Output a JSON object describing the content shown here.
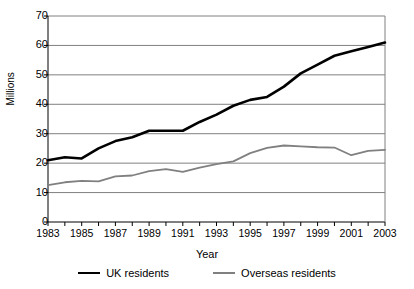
{
  "chart_data": {
    "type": "line",
    "title": "",
    "xlabel": "Year",
    "ylabel": "Millions",
    "xlim": [
      1983,
      2003
    ],
    "ylim": [
      0,
      70
    ],
    "ytick_step": 10,
    "yticks": [
      70,
      60,
      50,
      40,
      30,
      20,
      10,
      0
    ],
    "xticks": [
      1983,
      1984,
      1985,
      1986,
      1987,
      1988,
      1989,
      1990,
      1991,
      1992,
      1993,
      1994,
      1995,
      1996,
      1997,
      1998,
      1999,
      2000,
      2001,
      2002,
      2003
    ],
    "xtick_labels": [
      "1983",
      "",
      "1985",
      "",
      "1987",
      "",
      "1989",
      "",
      "1991",
      "",
      "1993",
      "",
      "1995",
      "",
      "1997",
      "",
      "1999",
      "",
      "2001",
      "",
      "2003"
    ],
    "grid": "horizontal",
    "legend_position": "bottom",
    "x": [
      1983,
      1984,
      1985,
      1986,
      1987,
      1988,
      1989,
      1990,
      1991,
      1992,
      1993,
      1994,
      1995,
      1996,
      1997,
      1998,
      1999,
      2000,
      2001,
      2002,
      2003
    ],
    "series": [
      {
        "name": "UK residents",
        "color": "#000000",
        "values": [
          21.0,
          22.0,
          21.6,
          25.0,
          27.5,
          28.8,
          31.0,
          31.0,
          31.0,
          34.0,
          36.5,
          39.5,
          41.5,
          42.5,
          46.0,
          50.5,
          53.5,
          56.5,
          58.0,
          59.5,
          61.0
        ]
      },
      {
        "name": "Overseas residents",
        "color": "#808080",
        "values": [
          12.5,
          13.5,
          14.0,
          13.8,
          15.5,
          15.8,
          17.3,
          18.0,
          17.0,
          18.5,
          19.7,
          20.6,
          23.4,
          25.2,
          26.0,
          25.7,
          25.4,
          25.3,
          22.7,
          24.2,
          24.5
        ]
      }
    ]
  },
  "legend": {
    "items": [
      {
        "label": "UK residents"
      },
      {
        "label": "Overseas residents"
      }
    ]
  }
}
